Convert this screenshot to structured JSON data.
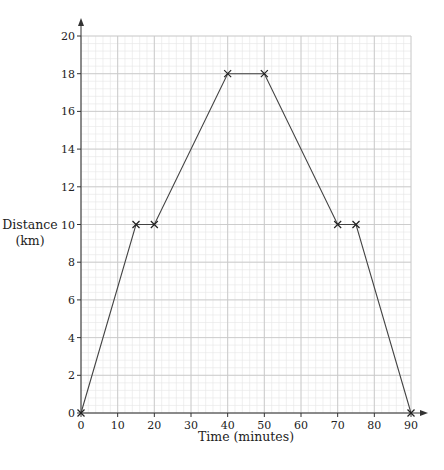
{
  "chart_data": {
    "type": "line",
    "title": "",
    "xlabel": "Time (minutes)",
    "ylabel": "Distance (km)",
    "ylabel_lines": [
      "Distance",
      "(km)"
    ],
    "xlim": [
      0,
      90
    ],
    "ylim": [
      0,
      20
    ],
    "x_ticks": [
      0,
      10,
      20,
      30,
      40,
      50,
      60,
      70,
      80,
      90
    ],
    "y_ticks": [
      0,
      2,
      4,
      6,
      8,
      10,
      12,
      14,
      16,
      18,
      20
    ],
    "grid": true,
    "grid_minor_x": 2,
    "grid_minor_y": 0.4,
    "legend": null,
    "series": [
      {
        "name": "journey",
        "marker": "x",
        "x": [
          0,
          15,
          20,
          40,
          50,
          70,
          75,
          90
        ],
        "y": [
          0,
          10,
          10,
          18,
          18,
          10,
          10,
          0
        ]
      }
    ]
  },
  "colors": {
    "line": "#444444",
    "major_grid": "#c8c8c8",
    "minor_grid": "#e6e6e6",
    "axis": "#333333"
  }
}
